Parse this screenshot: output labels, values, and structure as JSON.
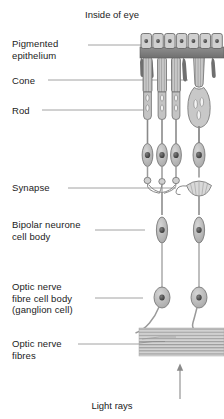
{
  "diagram": {
    "title": "Inside of eye",
    "bottom_caption": "Light rays",
    "colors": {
      "cell_fill": "#bdbdbd",
      "cell_fill_light": "#d4d4d4",
      "nucleus": "#4a4a4a",
      "outline": "#6e6e6e",
      "epithelium_band": "#8a8a8a",
      "fibre_band": "#c9c9c9",
      "leader_line": "#8c8c8c",
      "text": "#1b1b1b",
      "background": "#ffffff"
    },
    "labels": [
      {
        "id": "pigmented-epithelium",
        "text": "Pigmented\nepithelium",
        "x": 12,
        "y": 38,
        "leader_y": 45,
        "leader_x1": 88,
        "leader_x2": 144
      },
      {
        "id": "cone",
        "text": "Cone",
        "x": 12,
        "y": 76,
        "leader_y": 80,
        "leader_x1": 48,
        "leader_x2": 187
      },
      {
        "id": "rod",
        "text": "Rod",
        "x": 12,
        "y": 106,
        "leader_y": 110,
        "leader_x1": 42,
        "leader_x2": 143
      },
      {
        "id": "synapse",
        "text": "Synapse",
        "x": 12,
        "y": 183,
        "leader_y": 188,
        "leader_x1": 68,
        "leader_x2": 175
      },
      {
        "id": "bipolar-neurone-cell-body",
        "text": "Bipolar neurone\ncell body",
        "x": 12,
        "y": 219,
        "leader_y": 230,
        "leader_x1": 95,
        "leader_x2": 144
      },
      {
        "id": "optic-nerve-fibre-cell-body",
        "text": "Optic nerve\nfibre cell body\n(ganglion cell)",
        "x": 12,
        "y": 281,
        "leader_y": 298,
        "leader_x1": 95,
        "leader_x2": 142
      },
      {
        "id": "optic-nerve-fibres",
        "text": "Optic nerve\nfibres",
        "x": 12,
        "y": 340,
        "leader_y": 344,
        "leader_x1": 78,
        "leader_x2": 138
      }
    ],
    "structures": {
      "epithelium_cell_count": 7,
      "rod_columns": 3,
      "cone_columns": 1,
      "bipolar_cells": 2,
      "ganglion_cells": 2,
      "fibre_band_stripes": 9
    }
  }
}
